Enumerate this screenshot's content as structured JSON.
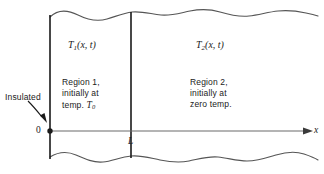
{
  "figure": {
    "background_color": "#ffffff",
    "line_color": "#1a1a1a",
    "wave_color": "#555555",
    "axis_color": "#6a6a6a",
    "width": 324,
    "height": 174
  },
  "labels": {
    "t1": {
      "base": "T",
      "sub": "1",
      "args": "(x, t)"
    },
    "t2": {
      "base": "T",
      "sub": "2",
      "args": "(x, t)"
    },
    "region1": {
      "line1": "Region 1,",
      "line2": "initially at",
      "line3_prefix": "temp. ",
      "line3_var": "T",
      "line3_sub": "0"
    },
    "region2": {
      "line1": "Region 2,",
      "line2": "initially at",
      "line3": "zero temp."
    },
    "insulated": "Insulated",
    "origin": "0",
    "interface": "L",
    "axis_x": "x"
  },
  "geometry": {
    "left_wall_x": 50,
    "interface_x": 131,
    "axis_y": 131,
    "axis_end_x": 310,
    "top_wave_y": 16,
    "bottom_wave_y": 158
  }
}
